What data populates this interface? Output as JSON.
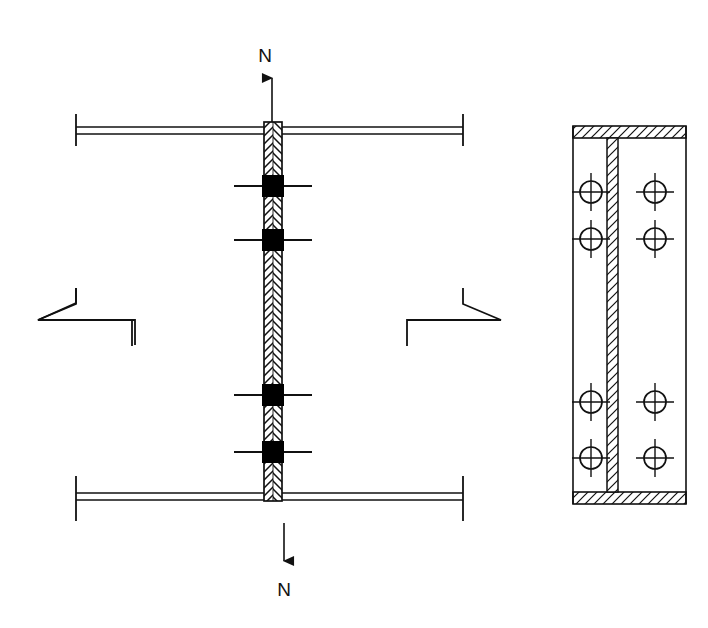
{
  "drawing": {
    "title": "Bolted web splice connection detail",
    "type": "engineering-detail",
    "background_color": "#ffffff",
    "line_color": "#111111",
    "fill_solid_color": "#000000",
    "labels": {
      "section_top": "N",
      "section_bottom": "N"
    },
    "elevation_view": {
      "name": "elevation",
      "beam": {
        "left_x": 76,
        "right_x": 463,
        "top_flange_y": 127,
        "bottom_flange_y": 496,
        "flange_band_height": 7,
        "end_tick_extension": 24
      },
      "splice_plate": {
        "name": "vertical-splice-plate",
        "x": 264,
        "width": 18,
        "top_y": 122,
        "bottom_y": 501,
        "hatch": "herringbone"
      },
      "bolts": [
        {
          "cy": 186,
          "label": "bolt-1"
        },
        {
          "cy": 240,
          "label": "bolt-2"
        },
        {
          "cy": 395,
          "label": "bolt-3"
        },
        {
          "cy": 452,
          "label": "bolt-4"
        }
      ],
      "bolt_block": {
        "height": 22,
        "tick_half_length": 30
      },
      "break_lines": [
        {
          "side": "left",
          "y": 318
        },
        {
          "side": "right",
          "y": 318
        }
      ],
      "section_arrows": {
        "top": {
          "x": 272,
          "from_y": 122,
          "to_y": 72,
          "label_y": 60
        },
        "bottom": {
          "x": 284,
          "from_y": 523,
          "to_y": 567,
          "label_y": 595
        }
      }
    },
    "section_view": {
      "name": "section-n-n",
      "outline": {
        "x": 573,
        "y": 126,
        "width": 113,
        "height": 378
      },
      "flange_band_height": 12,
      "web_plate": {
        "x": 607,
        "width": 11
      },
      "bolt_columns_x": [
        591,
        655
      ],
      "bolt_rows_y": [
        192,
        239,
        402,
        458
      ],
      "bolt_circle_radius": 11,
      "bolt_tick_extension": 8,
      "hatch": "diagonal-45"
    }
  }
}
